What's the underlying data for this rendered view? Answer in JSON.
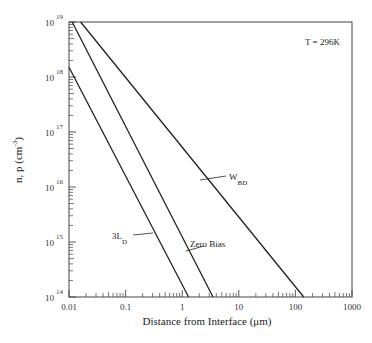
{
  "chart_data": {
    "type": "line",
    "title": "",
    "annotation": "T = 296K",
    "xlabel": "Distance from Interface (μm)",
    "ylabel": "n, p (cm^-3)",
    "xscale": "log",
    "yscale": "log",
    "xlim": [
      0.01,
      1000
    ],
    "ylim": [
      100000000000000.0,
      1e+19
    ],
    "grid": false,
    "legend": "none (inline labels)",
    "x_ticks": [
      "0.01",
      "0.1",
      "1",
      "10",
      "100",
      "1000"
    ],
    "y_ticks": [
      {
        "base": "10",
        "exp": "14"
      },
      {
        "base": "10",
        "exp": "15"
      },
      {
        "base": "10",
        "exp": "16"
      },
      {
        "base": "10",
        "exp": "17"
      },
      {
        "base": "10",
        "exp": "18"
      },
      {
        "base": "10",
        "exp": "19"
      }
    ],
    "series": [
      {
        "name": "3L_D",
        "label_main": "3L",
        "label_sub": "D",
        "points": [
          [
            0.01,
            1.5e+18
          ],
          [
            1.3,
            100000000000000.0
          ]
        ]
      },
      {
        "name": "Zero Bias",
        "label_main": "Zero Bias",
        "label_sub": "",
        "points": [
          [
            0.0114,
            1e+19
          ],
          [
            3.5,
            100000000000000.0
          ]
        ]
      },
      {
        "name": "W_BD",
        "label_main": "W",
        "label_sub": "BD",
        "points": [
          [
            0.016,
            1e+19
          ],
          [
            140,
            100000000000000.0
          ]
        ]
      }
    ]
  },
  "labels": {
    "temperature": "T = 296K",
    "xlabel": "Distance from Interface (μm)",
    "ylabel_main": "n, p (cm",
    "ylabel_exp": "-3",
    "ylabel_close": ")"
  },
  "colors": {
    "line": "#222222",
    "background": "#ffffff"
  }
}
